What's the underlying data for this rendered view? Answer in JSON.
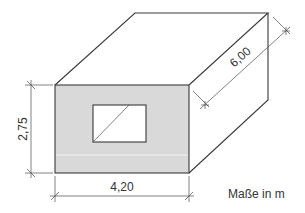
{
  "diagram": {
    "type": "isometric-box-dimension-drawing",
    "colors": {
      "front_face_fill": "#d9d9d9",
      "line": "#3a3a3a",
      "background": "#ffffff"
    },
    "dimensions": {
      "height": "2,75",
      "width": "4,20",
      "depth": "6,00"
    },
    "units_note": "Maße in m",
    "features": {
      "front_face": "shaded wall with window opening",
      "window": "rectangular opening with diagonal line"
    }
  }
}
